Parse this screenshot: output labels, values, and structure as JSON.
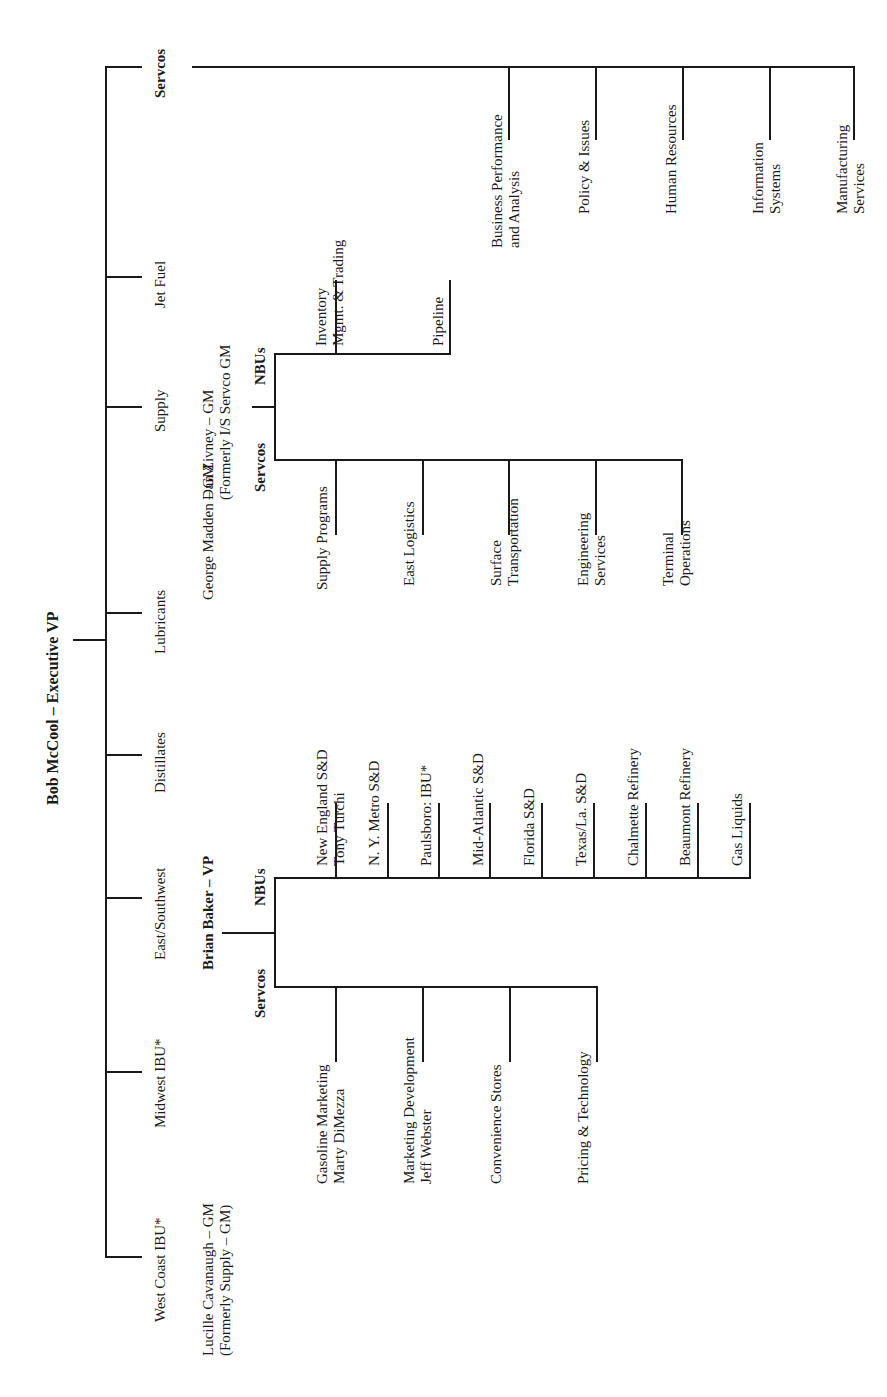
{
  "root": {
    "label": "Bob McCool – Executive VP"
  },
  "divisions": [
    {
      "label": "Servcos",
      "bold": true
    },
    {
      "label": "Jet Fuel"
    },
    {
      "label": "Supply"
    },
    {
      "label": "Lubricants"
    },
    {
      "label": "Distillates"
    },
    {
      "label": "East/Southwest"
    },
    {
      "label": "Midwest IBU*"
    },
    {
      "label": "West Coast IBU*"
    }
  ],
  "servcos": {
    "items": [
      {
        "line1": "Business Performance",
        "line2": "and Analysis"
      },
      {
        "line1": "Policy & Issues"
      },
      {
        "line1": "Human Resources"
      },
      {
        "line1": "Information",
        "line2": "Systems"
      },
      {
        "line1": "Manufacturing",
        "line2": "Services"
      }
    ]
  },
  "supply": {
    "manager": {
      "line1": "Dan Zivney – GM",
      "line2": "(Formerly I/S Servco GM"
    },
    "nbus_label": "NBUs",
    "servcos_label": "Servcos",
    "nbus": [
      {
        "line1": "Inventory",
        "line2": "Mgmt. & Trading"
      },
      {
        "line1": "Pipeline"
      }
    ],
    "servcos": [
      {
        "line1": "Supply Programs"
      },
      {
        "line1": "East Logistics"
      },
      {
        "line1": "Surface",
        "line2": "Transportation"
      },
      {
        "line1": "Engineering",
        "line2": "Services"
      },
      {
        "line1": "Terminal",
        "line2": "Operations"
      }
    ]
  },
  "lubricants": {
    "manager": "George Madden – GM"
  },
  "east_southwest": {
    "manager": "Brian Baker – VP",
    "nbus_label": "NBUs",
    "servcos_label": "Servcos",
    "nbus": [
      {
        "line1": "New England S&D",
        "line2": "Tony Turchi"
      },
      {
        "line1": "N. Y. Metro S&D"
      },
      {
        "line1": "Paulsboro: IBU*"
      },
      {
        "line1": "Mid-Atlantic S&D"
      },
      {
        "line1": "Florida S&D"
      },
      {
        "line1": "Texas/La. S&D"
      },
      {
        "line1": "Chalmette Refinery"
      },
      {
        "line1": "Beaumont Refinery"
      },
      {
        "line1": "Gas Liquids"
      }
    ],
    "servcos": [
      {
        "line1": "Gasoline Marketing",
        "line2": "Marty DiMezza"
      },
      {
        "line1": "Marketing Development",
        "line2": "Jeff Webster"
      },
      {
        "line1": "Convenience Stores"
      },
      {
        "line1": "Pricing & Technology"
      }
    ]
  },
  "west_coast": {
    "manager": {
      "line1": "Lucille Cavanaugh – GM",
      "line2": "(Formerly Supply – GM)"
    }
  }
}
